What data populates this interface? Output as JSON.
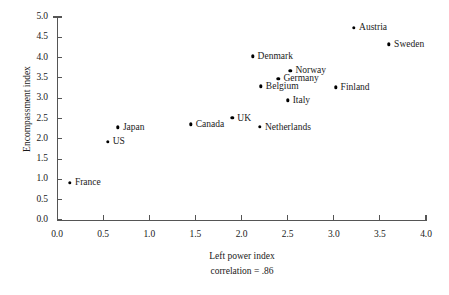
{
  "chart_data": {
    "type": "scatter",
    "title": "",
    "xlabel": "Left power index",
    "ylabel": "Encompassment index",
    "annotation": "correlation = .86",
    "xlim": [
      0.0,
      4.0
    ],
    "ylim": [
      0.0,
      5.0
    ],
    "grid": false,
    "legend": "none",
    "xticks": [
      "0.0",
      "0.5",
      "1.0",
      "1.5",
      "2.0",
      "2.5",
      "3.0",
      "3.5",
      "4.0"
    ],
    "xtick_values": [
      0.0,
      0.5,
      1.0,
      1.5,
      2.0,
      2.5,
      3.0,
      3.5,
      4.0
    ],
    "yticks": [
      "0.0",
      "0.5",
      "1.0",
      "1.5",
      "2.0",
      "2.5",
      "3.0",
      "3.5",
      "4.0",
      "4.5",
      "5.0"
    ],
    "ytick_values": [
      0.0,
      0.5,
      1.0,
      1.5,
      2.0,
      2.5,
      3.0,
      3.5,
      4.0,
      4.5,
      5.0
    ],
    "points": [
      {
        "label": "France",
        "x": 0.14,
        "y": 0.92,
        "label_pos": "right"
      },
      {
        "label": "US",
        "x": 0.55,
        "y": 1.93,
        "label_pos": "right"
      },
      {
        "label": "Japan",
        "x": 0.66,
        "y": 2.28,
        "label_pos": "right"
      },
      {
        "label": "Canada",
        "x": 1.45,
        "y": 2.36,
        "label_pos": "right"
      },
      {
        "label": "UK",
        "x": 1.9,
        "y": 2.51,
        "label_pos": "right"
      },
      {
        "label": "Netherlands",
        "x": 2.2,
        "y": 2.29,
        "label_pos": "right"
      },
      {
        "label": "Italy",
        "x": 2.5,
        "y": 2.95,
        "label_pos": "right"
      },
      {
        "label": "Belgium",
        "x": 2.21,
        "y": 3.29,
        "label_pos": "right"
      },
      {
        "label": "Germany",
        "x": 2.4,
        "y": 3.48,
        "label_pos": "right"
      },
      {
        "label": "Norway",
        "x": 2.53,
        "y": 3.67,
        "label_pos": "right"
      },
      {
        "label": "Denmark",
        "x": 2.12,
        "y": 4.03,
        "label_pos": "right"
      },
      {
        "label": "Finland",
        "x": 3.02,
        "y": 3.27,
        "label_pos": "right"
      },
      {
        "label": "Austria",
        "x": 3.22,
        "y": 4.73,
        "label_pos": "right"
      },
      {
        "label": "Sweden",
        "x": 3.6,
        "y": 4.33,
        "label_pos": "right"
      }
    ]
  }
}
